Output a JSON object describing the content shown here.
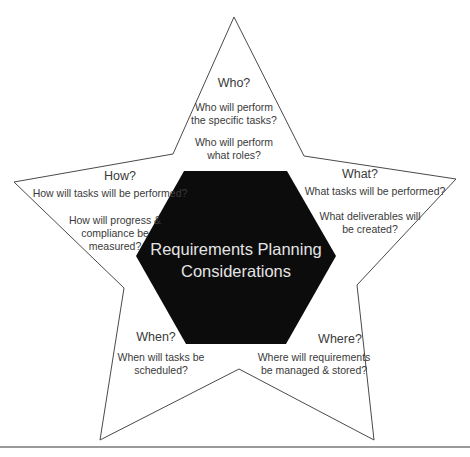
{
  "diagram": {
    "center": {
      "line1": "Requirements Planning",
      "line2": "Considerations"
    },
    "points": {
      "who": {
        "heading": "Who?",
        "q1_line1": "Who will perform",
        "q1_line2": "the specific tasks?",
        "q2_line1": "Who will perform",
        "q2_line2": "what roles?"
      },
      "what": {
        "heading": "What?",
        "q1_line1": "What tasks will be performed?",
        "q2_line1": "What deliverables will",
        "q2_line2": "be created?"
      },
      "how": {
        "heading": "How?",
        "q1_line1": "How will tasks will be performed?",
        "q2_line1": "How will progress &",
        "q2_line2": "compliance be",
        "q2_line3": "measured?"
      },
      "when": {
        "heading": "When?",
        "q1_line1": "When will tasks be",
        "q1_line2": "scheduled?"
      },
      "where": {
        "heading": "Where?",
        "q1_line1": "Where will requirements",
        "q1_line2": "be managed & stored?"
      }
    },
    "colors": {
      "star_stroke": "#4a4a4a",
      "hexagon_fill": "#0c0c0c",
      "center_text": "#e4e4e4",
      "label_text": "#3a3a3a"
    }
  }
}
